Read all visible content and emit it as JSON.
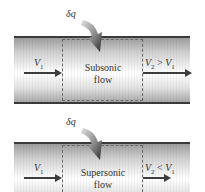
{
  "panels": [
    {
      "id": "subsonic",
      "heat_label": "δq",
      "flow_label_line1": "Subsonic",
      "flow_label_line2": "flow",
      "inlet_velocity": {
        "symbol": "V",
        "sub": "1"
      },
      "outlet_velocity": {
        "lhs_symbol": "V",
        "lhs_sub": "2",
        "relation": " > ",
        "rhs_symbol": "V",
        "rhs_sub": "1"
      }
    },
    {
      "id": "supersonic",
      "heat_label": "δq",
      "flow_label_line1": "Supersonic",
      "flow_label_line2": "flow",
      "inlet_velocity": {
        "symbol": "V",
        "sub": "1"
      },
      "outlet_velocity": {
        "lhs_symbol": "V",
        "lhs_sub": "2",
        "relation": " < ",
        "rhs_symbol": "V",
        "rhs_sub": "1"
      }
    }
  ],
  "colors": {
    "pipe_wall": "#3a3a3a",
    "arrow": "#3c3c3c",
    "heat_arrow_dark": "#3a3a3a",
    "heat_arrow_light": "#d8d8d8"
  }
}
